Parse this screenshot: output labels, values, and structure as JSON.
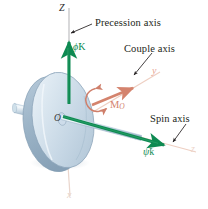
{
  "figure": {
    "background_color": "#ffffff"
  },
  "colors": {
    "green_vector": "#0e8a52",
    "salmon_axis": "#e8a48f",
    "couple_moment": "#d4836d",
    "disk_body": "#c8d7e4",
    "disk_edge": "#8ea6bb",
    "shaft": "#bfd0dd",
    "leader_line": "#231f20",
    "axis_dark": "#2b2b2b"
  },
  "annotations": [
    {
      "id": "precession",
      "label": "Precession axis"
    },
    {
      "id": "couple",
      "label": "Couple axis"
    },
    {
      "id": "spin",
      "label": "Spin axis"
    }
  ],
  "axes": [
    {
      "id": "axis-Z",
      "label": "Z",
      "color": "#2b2b2b",
      "direction": "vertical-up"
    },
    {
      "id": "axis-x",
      "label": "x",
      "color": "#e8a48f",
      "direction": "down"
    },
    {
      "id": "axis-y",
      "label": "y",
      "color": "#e8a48f",
      "direction": "upper-right"
    },
    {
      "id": "axis-z",
      "label": "z",
      "color": "#e8a48f",
      "direction": "lower-right"
    }
  ],
  "vectors": [
    {
      "id": "precession-vector",
      "symbol": "ϕ",
      "dot": "̇",
      "unit": "K",
      "color": "#0e8a52",
      "meaning": "precession angular velocity"
    },
    {
      "id": "spin-vector",
      "symbol": "ψ",
      "dot": "̇",
      "unit": "k",
      "color": "#0e8a52",
      "meaning": "spin angular velocity"
    },
    {
      "id": "couple-moment-vector",
      "symbol": "M",
      "subscript": "O",
      "color": "#d4836d",
      "meaning": "applied couple moment about O"
    }
  ],
  "points": [
    {
      "id": "origin",
      "label": "O"
    }
  ]
}
